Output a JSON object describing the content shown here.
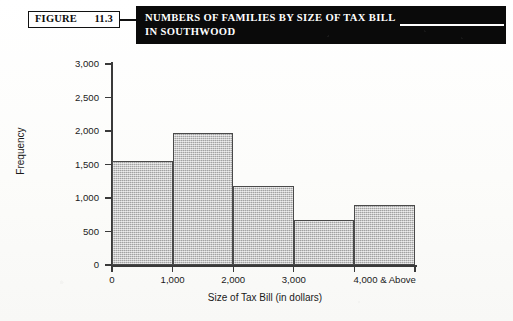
{
  "figure": {
    "tag_word": "FIGURE",
    "number": "11.3",
    "title_line1": "NUMBERS OF FAMILIES BY SIZE OF TAX BILL",
    "title_line2": "IN SOUTHWOOD"
  },
  "colors": {
    "banner_background": "#0a0a0a",
    "banner_text": "#ffffff",
    "bar_fill": "#b9b9b9",
    "bar_border": "#4a4a4a",
    "axis": "#3a3a3a",
    "page_background": "#ffffff"
  },
  "chart_data": {
    "type": "bar",
    "title": "NUMBERS OF FAMILIES BY SIZE OF TAX BILL IN SOUTHWOOD",
    "xlabel": "Size of Tax Bill (in dollars)",
    "ylabel": "Frequency",
    "categories": [
      "0-1,000",
      "1,000-2,000",
      "2,000-3,000",
      "3,000-4,000",
      "4,000 & Above"
    ],
    "values": [
      1550,
      1975,
      1180,
      670,
      900
    ],
    "x_tick_labels": [
      "0",
      "1,000",
      "2,000",
      "3,000",
      "4,000 & Above"
    ],
    "y_tick_labels": [
      "0",
      "500",
      "1,000",
      "1,500",
      "2,000",
      "2,500",
      "3,000"
    ],
    "y_tick_values": [
      0,
      500,
      1000,
      1500,
      2000,
      2500,
      3000
    ],
    "ylim": [
      0,
      3000
    ],
    "grid": false,
    "legend": false
  }
}
